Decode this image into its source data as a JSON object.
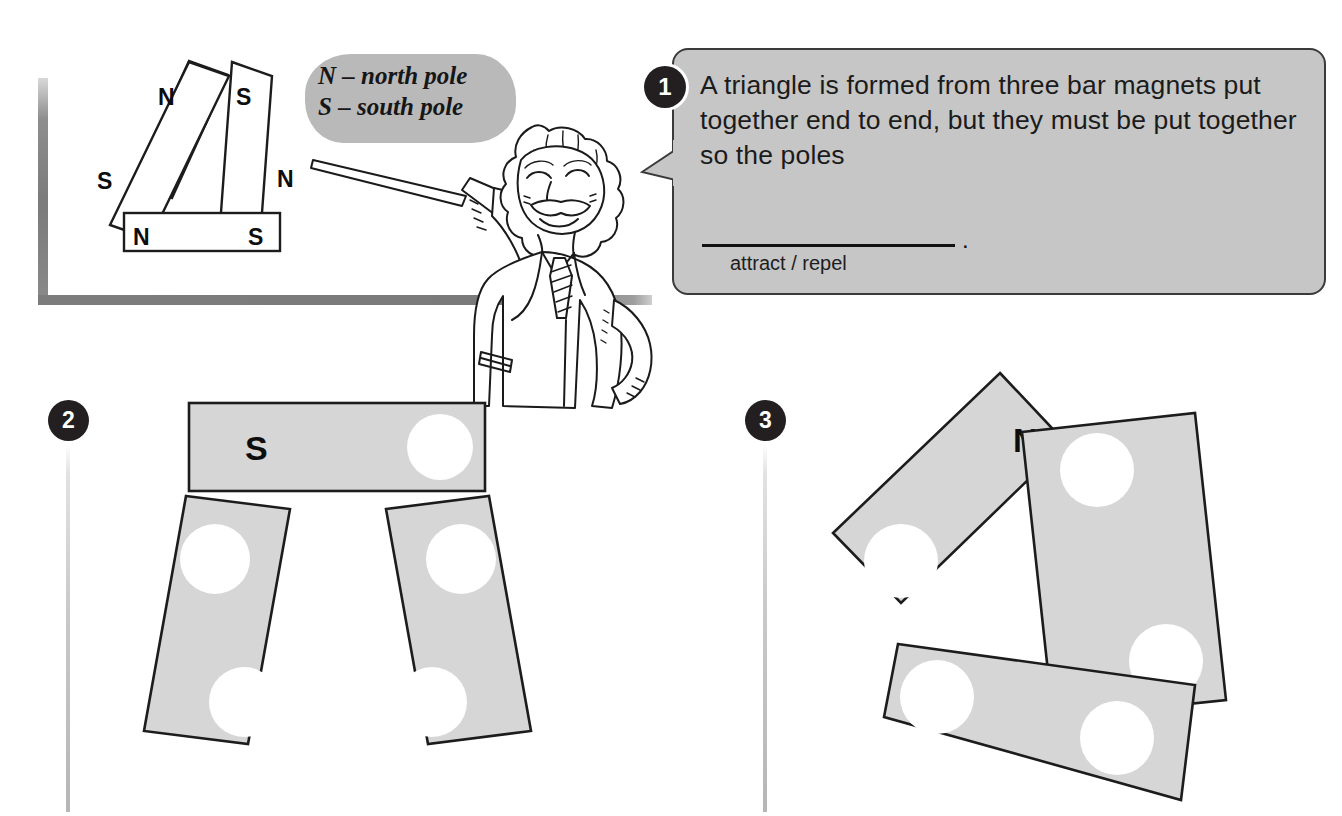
{
  "legend": {
    "line1": "N – north pole",
    "line2": "S – south pole",
    "text": "N – north pole\nS – south pole"
  },
  "questions": [
    {
      "number": "1",
      "body": "A triangle is formed from three bar magnets put together end to end, but they must be put together so the poles",
      "answer_hint": "attract / repel",
      "period": "."
    },
    {
      "number": "2"
    },
    {
      "number": "3"
    }
  ],
  "top_figure": {
    "name": "bar-magnet-triangle-worked-example",
    "labels": {
      "left_top": "N",
      "right_top": "S",
      "left_bottom": "S",
      "right_bottom": "N",
      "base_left": "N",
      "base_right": "S"
    }
  },
  "figure_2": {
    "label": "S",
    "magnet_count": 3,
    "hole_count": 6
  },
  "figure_3": {
    "label": "N",
    "magnet_count": 3,
    "hole_count": 6
  },
  "colors": {
    "bubble_fill": "#c6c6c6",
    "bubble_stroke": "#3a3a3a",
    "legend_fill": "#b9b9b9",
    "magnet_fill": "#d6d6d6",
    "outline": "#1c1c1c",
    "badge_fill": "#231f20",
    "frame_grey": "#7c7c7c"
  }
}
